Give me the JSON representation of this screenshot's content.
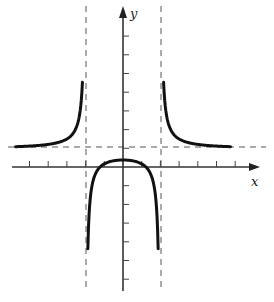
{
  "chart_data": {
    "type": "line",
    "title": "",
    "xlabel": "x",
    "ylabel": "y",
    "function_description": "Rational function with vertical asymptotes at x = -2 and x = 2 and horizontal asymptote at y = 1",
    "approx_function": "y = (x^2 - 1.5) / (x^2 - 4)",
    "vertical_asymptotes": [
      -2,
      2
    ],
    "horizontal_asymptote": 1,
    "xlim": [
      -6,
      7
    ],
    "ylim": [
      -7,
      7.5
    ],
    "x_ticks": [
      -5,
      -4,
      -3,
      -2,
      -1,
      1,
      2,
      3,
      4,
      5,
      6
    ],
    "y_ticks": [
      -6,
      -5,
      -4,
      -3,
      -2,
      -1,
      1,
      2,
      3,
      4,
      5,
      6,
      7
    ],
    "tick_labels_shown": false,
    "grid": false,
    "legend": null,
    "series": [
      {
        "name": "left-branch",
        "x": [
          -5.9,
          -5,
          -4,
          -3,
          -2.6,
          -2.4,
          -2.3,
          -2.25
        ],
        "y": [
          1.08,
          1.12,
          1.21,
          1.5,
          1.9,
          2.4,
          2.9,
          3.3
        ]
      },
      {
        "name": "middle-branch",
        "x": [
          -1.85,
          -1.6,
          -1.2,
          -0.8,
          0,
          0.8,
          1.2,
          1.6,
          1.85
        ],
        "y": [
          -3.4,
          -0.75,
          0.02,
          0.26,
          0.375,
          0.26,
          0.02,
          -0.75,
          -3.4
        ]
      },
      {
        "name": "right-branch",
        "x": [
          2.25,
          2.3,
          2.4,
          2.6,
          3,
          4,
          5,
          6
        ],
        "y": [
          3.3,
          2.9,
          2.4,
          1.9,
          1.5,
          1.21,
          1.12,
          1.08
        ]
      }
    ],
    "annotations": []
  },
  "labels": {
    "x_axis": "x",
    "y_axis": "y"
  }
}
